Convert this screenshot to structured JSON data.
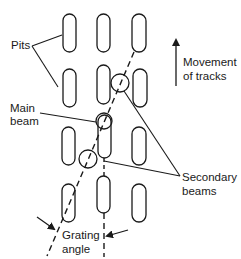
{
  "diagram": {
    "labels": {
      "pits": "Pits",
      "main_beam_line1": "Main",
      "main_beam_line2": "beam",
      "movement_line1": "Movement",
      "movement_line2": "of tracks",
      "secondary_line1": "Secondary",
      "secondary_line2": "beams",
      "grating_line1": "Grating",
      "grating_line2": "angle"
    },
    "colors": {
      "stroke": "#1a1a1a",
      "background": "#ffffff"
    },
    "pits": [
      {
        "col": 1,
        "row": 1,
        "x": 63,
        "y": 14,
        "w": 13,
        "h": 38
      },
      {
        "col": 2,
        "row": 1,
        "x": 97,
        "y": 14,
        "w": 13,
        "h": 38
      },
      {
        "col": 3,
        "row": 1,
        "x": 132,
        "y": 14,
        "w": 14,
        "h": 38
      },
      {
        "col": 1,
        "row": 2,
        "x": 63,
        "y": 69,
        "w": 13,
        "h": 38
      },
      {
        "col": 2,
        "row": 2,
        "x": 97,
        "y": 65,
        "w": 13,
        "h": 39
      },
      {
        "col": 3,
        "row": 2,
        "x": 133,
        "y": 69,
        "w": 14,
        "h": 38
      },
      {
        "col": 1,
        "row": 3,
        "x": 62,
        "y": 127,
        "w": 13,
        "h": 38
      },
      {
        "col": 2,
        "row": 3,
        "x": 98,
        "y": 115,
        "w": 13,
        "h": 43
      },
      {
        "col": 3,
        "row": 3,
        "x": 132,
        "y": 127,
        "w": 14,
        "h": 38
      },
      {
        "col": 1,
        "row": 4,
        "x": 62,
        "y": 184,
        "w": 13,
        "h": 38
      },
      {
        "col": 2,
        "row": 4,
        "x": 97,
        "y": 176,
        "w": 13,
        "h": 37
      },
      {
        "col": 3,
        "row": 4,
        "x": 132,
        "y": 184,
        "w": 14,
        "h": 38
      }
    ],
    "beams": [
      {
        "name": "main",
        "cx": 104,
        "cy": 121,
        "r": 8
      },
      {
        "name": "secondary-upper",
        "cx": 120,
        "cy": 83,
        "r": 9
      },
      {
        "name": "secondary-lower",
        "cx": 88,
        "cy": 159,
        "r": 9
      }
    ]
  }
}
